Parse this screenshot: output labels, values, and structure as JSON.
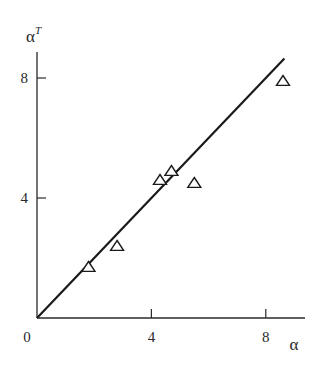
{
  "chart_data": {
    "type": "scatter",
    "title": "",
    "xlabel": "α",
    "ylabel": "α",
    "ylabel_superscript": "T",
    "xlim": [
      0,
      9.4
    ],
    "ylim": [
      0,
      8.9
    ],
    "x_ticks": [
      4,
      8
    ],
    "y_ticks": [
      4,
      8
    ],
    "origin_label": "0",
    "grid": false,
    "legend": null,
    "series": [
      {
        "name": "data",
        "marker": "triangle-open",
        "points": [
          {
            "x": 1.8,
            "y": 1.7
          },
          {
            "x": 2.8,
            "y": 2.4
          },
          {
            "x": 4.3,
            "y": 4.6
          },
          {
            "x": 4.7,
            "y": 4.9
          },
          {
            "x": 5.5,
            "y": 4.5
          },
          {
            "x": 8.6,
            "y": 7.9
          }
        ]
      },
      {
        "name": "fit line",
        "style": "solid-line",
        "points": [
          {
            "x": 0,
            "y": 0
          },
          {
            "x": 8.65,
            "y": 8.65
          }
        ]
      }
    ]
  },
  "colors": {
    "ink": "#1a1a1a",
    "axis": "#2a2a2a",
    "background": "#ffffff"
  }
}
